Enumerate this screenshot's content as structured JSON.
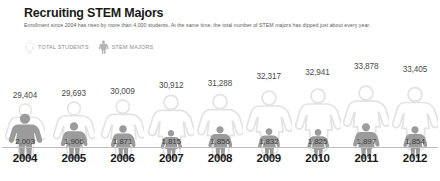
{
  "header": {
    "title": "Recruiting STEM Majors",
    "subtitle": "Enrollment since 2004 has risen by more than 4,000 students. At the same time, the total number of STEM majors has dipped just about every year."
  },
  "legend": {
    "items": [
      {
        "label": "TOTAL STUDENTS",
        "icon": "person-outline-icon",
        "color": "#e2e2e2"
      },
      {
        "label": "STEM MAJORS",
        "icon": "person-solid-icon",
        "color": "#9a9a9a"
      }
    ]
  },
  "colors": {
    "total_figure_stroke": "#e3e3e3",
    "total_figure_fill": "#ffffff",
    "stem_figure_fill": "#9b9b9b",
    "axis_line": "#bbbbbb",
    "title": "#1a1a1a",
    "subtitle": "#5d5d5d",
    "total_number": "#4a4a4a",
    "stem_number": "#3d3d3d",
    "year": "#1a1a1a",
    "legend_label": "#8a8a8a",
    "background": "#ffffff"
  },
  "chart_data": {
    "type": "bar",
    "title": "Recruiting STEM Majors",
    "subtitle": "Enrollment since 2004 has risen by more than 4,000 students. At the same time, the total number of STEM majors has dipped just about every year.",
    "xlabel": "",
    "ylabel": "",
    "categories": [
      "2004",
      "2005",
      "2006",
      "2007",
      "2008",
      "2009",
      "2010",
      "2011",
      "2012"
    ],
    "series": [
      {
        "name": "TOTAL STUDENTS",
        "values": [
          29404,
          29693,
          30009,
          30912,
          31288,
          32317,
          32941,
          33878,
          33405
        ],
        "labels": [
          "29,404",
          "29,693",
          "30,009",
          "30,912",
          "31,288",
          "32,317",
          "32,941",
          "33,878",
          "33,405"
        ]
      },
      {
        "name": "STEM MAJORS",
        "values": [
          2003,
          1906,
          1871,
          1815,
          1856,
          1832,
          1825,
          1897,
          1854
        ],
        "labels": [
          "2,003",
          "1,906",
          "1,871",
          "1,815",
          "1,856",
          "1,832",
          "1,825",
          "1,897",
          "1,854"
        ]
      }
    ],
    "legend_position": "top-left",
    "grid": false,
    "glyph": "human-pictogram"
  }
}
